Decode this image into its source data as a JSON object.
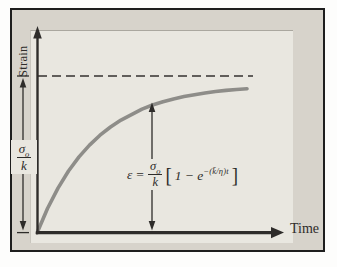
{
  "figure": {
    "ylabel": "Strain",
    "xlabel": "Time"
  },
  "y_value_label": {
    "numerator": "σ",
    "numerator_sub": "o",
    "denominator": "k"
  },
  "equation": {
    "lhs": "ε",
    "eq": "=",
    "numerator": "σ",
    "numerator_sub": "o",
    "denominator": "k",
    "open_bracket": "[",
    "body": "1 − e",
    "exponent": "−(k̄/η)t",
    "close_bracket": "]"
  },
  "colors": {
    "frame_background": "#d7d3cb",
    "panel_background": "#e9e7e0",
    "curve": "#8e8d89",
    "ink": "#2e2c2a"
  },
  "chart_data": {
    "type": "line",
    "title": "",
    "xlabel": "Time",
    "ylabel": "Strain",
    "axis_numeric_ticks": false,
    "x_normalized": true,
    "ylim": [
      0,
      1.1
    ],
    "asymptote": {
      "value": 1.0,
      "label": "σo/k̄",
      "style": "dashed"
    },
    "range_markers": [
      "left double-headed arrow spanning 0 to σo/k̄",
      "vertical double-headed arrow from time axis up to curve at equation"
    ],
    "annotation_equation": "ε = (σo/k̄)[1 − e^(−(k̄/η)t)]",
    "series": [
      {
        "name": "creep strain ε(t)",
        "x": [
          0,
          0.05,
          0.1,
          0.15,
          0.2,
          0.25,
          0.3,
          0.35,
          0.4,
          0.45,
          0.5,
          0.55,
          0.6,
          0.65,
          0.7,
          0.75,
          0.8,
          0.85,
          0.9,
          0.95,
          1.0
        ],
        "y": [
          0,
          0.156,
          0.286,
          0.395,
          0.485,
          0.56,
          0.623,
          0.675,
          0.719,
          0.754,
          0.789,
          0.815,
          0.836,
          0.854,
          0.869,
          0.881,
          0.892,
          0.901,
          0.908,
          0.914,
          0.919
        ]
      }
    ]
  }
}
